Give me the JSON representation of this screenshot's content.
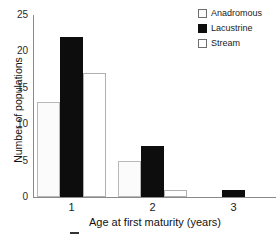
{
  "chart_data": {
    "type": "bar",
    "title": "",
    "xlabel": "Age at first maturity  (years)",
    "ylabel": "Number of populations",
    "categories": [
      "1",
      "2",
      "3"
    ],
    "series": [
      {
        "name": "Anadromous",
        "values": [
          13,
          5,
          0
        ],
        "color": "#fbfbfb",
        "edge": "#b8b8b8"
      },
      {
        "name": "Lacustrine",
        "values": [
          22,
          7,
          1
        ],
        "color": "#0d0d0d",
        "edge": "#0d0d0d"
      },
      {
        "name": "Stream",
        "values": [
          17,
          1,
          0
        ],
        "color": "#ffffff",
        "edge": "#b0b0b0"
      }
    ],
    "ylim": [
      0,
      25
    ],
    "yticks": [
      "0",
      "5",
      "10",
      "15",
      "20",
      "25"
    ],
    "ytick_values": [
      0,
      5,
      10,
      15,
      20,
      25
    ],
    "grid": false,
    "legend_position": "top-right"
  },
  "legend": {
    "items": [
      {
        "label": "Anadromous",
        "swatch": "light-open-square"
      },
      {
        "label": "Lacustrine",
        "swatch": "black-filled-square"
      },
      {
        "label": "Stream",
        "swatch": "white-open-square"
      }
    ]
  },
  "axes": {
    "y_title": "Number of populations",
    "x_title": "Age at first maturity  (years)",
    "y_ticks": [
      "25",
      "20",
      "15",
      "10",
      "5",
      "0"
    ],
    "x_ticks": [
      "1",
      "2",
      "3"
    ]
  }
}
